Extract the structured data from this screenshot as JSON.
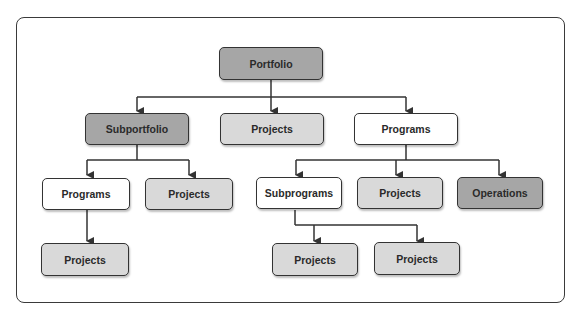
{
  "diagram": {
    "type": "org-hierarchy",
    "colors": {
      "dark": "#a6a6a6",
      "light": "#d9d9d9",
      "white": "#ffffff",
      "stroke": "#333333"
    },
    "nodes": {
      "portfolio": {
        "label": "Portfolio",
        "style": "dark"
      },
      "subportfolio": {
        "label": "Subportfolio",
        "style": "dark"
      },
      "projects_top": {
        "label": "Projects",
        "style": "light"
      },
      "programs_top": {
        "label": "Programs",
        "style": "white"
      },
      "programs_left": {
        "label": "Programs",
        "style": "white"
      },
      "projects_left_mid": {
        "label": "Projects",
        "style": "light"
      },
      "projects_left_bottom": {
        "label": "Projects",
        "style": "light"
      },
      "subprograms": {
        "label": "Subprograms",
        "style": "white"
      },
      "projects_right_mid": {
        "label": "Projects",
        "style": "light"
      },
      "operations": {
        "label": "Operations",
        "style": "dark"
      },
      "projects_sub_1": {
        "label": "Projects",
        "style": "light"
      },
      "projects_sub_2": {
        "label": "Projects",
        "style": "light"
      }
    },
    "edges": [
      [
        "portfolio",
        "subportfolio"
      ],
      [
        "portfolio",
        "projects_top"
      ],
      [
        "portfolio",
        "programs_top"
      ],
      [
        "subportfolio",
        "programs_left"
      ],
      [
        "subportfolio",
        "projects_left_mid"
      ],
      [
        "programs_left",
        "projects_left_bottom"
      ],
      [
        "programs_top",
        "subprograms"
      ],
      [
        "programs_top",
        "projects_right_mid"
      ],
      [
        "programs_top",
        "operations"
      ],
      [
        "subprograms",
        "projects_sub_1"
      ],
      [
        "subprograms",
        "projects_sub_2"
      ]
    ]
  }
}
